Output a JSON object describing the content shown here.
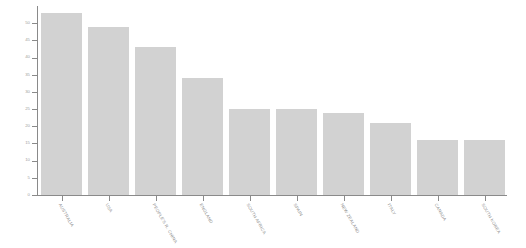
{
  "chart_data": {
    "type": "bar",
    "title": "",
    "subtitle": "",
    "xlabel": "",
    "ylabel": "",
    "categories": [
      "AUSTRALIA",
      "USA",
      "PEOPLE'S R. CHINA",
      "ENGLAND",
      "SOUTH AFRICA",
      "SPAIN",
      "NEW ZEALAND",
      "ITALY",
      "CANADA",
      "SOUTH KOREA"
    ],
    "values": [
      53,
      49,
      43,
      34,
      25,
      25,
      24,
      21,
      16,
      16
    ],
    "ylim": [
      0,
      53
    ],
    "yticks": [
      0,
      5,
      10,
      15,
      20,
      25,
      30,
      35,
      40,
      45,
      50
    ],
    "ytick_labels": [
      "0",
      "5",
      "10",
      "15",
      "20",
      "25",
      "30",
      "35",
      "40",
      "45",
      "50"
    ],
    "grid": false,
    "legend": null,
    "bar_color": "#d2d2d2",
    "axis_color": "#8a8a8a",
    "tick_label_color": "#9a9a9a",
    "background_color": "#ffffff"
  }
}
